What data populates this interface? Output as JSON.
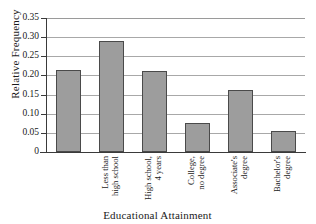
{
  "chart_data": {
    "type": "bar",
    "title": "",
    "xlabel": "Educational Attainment",
    "ylabel": "Relative Frequency",
    "categories": [
      "Less than\nhigh school",
      "High school,\n4 years",
      "College,\nno degree",
      "Associate's\ndegree",
      "Bachelor's\ndegree",
      "Graduate or\nProfessional\ndegree"
    ],
    "values": [
      0.214,
      0.29,
      0.211,
      0.076,
      0.163,
      0.055
    ],
    "ylim": [
      0,
      0.35
    ],
    "yticks": [
      0,
      0.05,
      0.1,
      0.15,
      0.2,
      0.25,
      0.3,
      0.35
    ],
    "ytick_labels": [
      "0",
      "0.05",
      "0.10",
      "0.15",
      "0.20",
      "0.25",
      "0.30",
      "0.35"
    ],
    "grid": true,
    "legend": false,
    "bar_color": "#9d9d9d",
    "bar_edge_color": "#4a4a4a",
    "axis_color": "#3a3a3a",
    "gridline_color": "#a8a8a8"
  }
}
